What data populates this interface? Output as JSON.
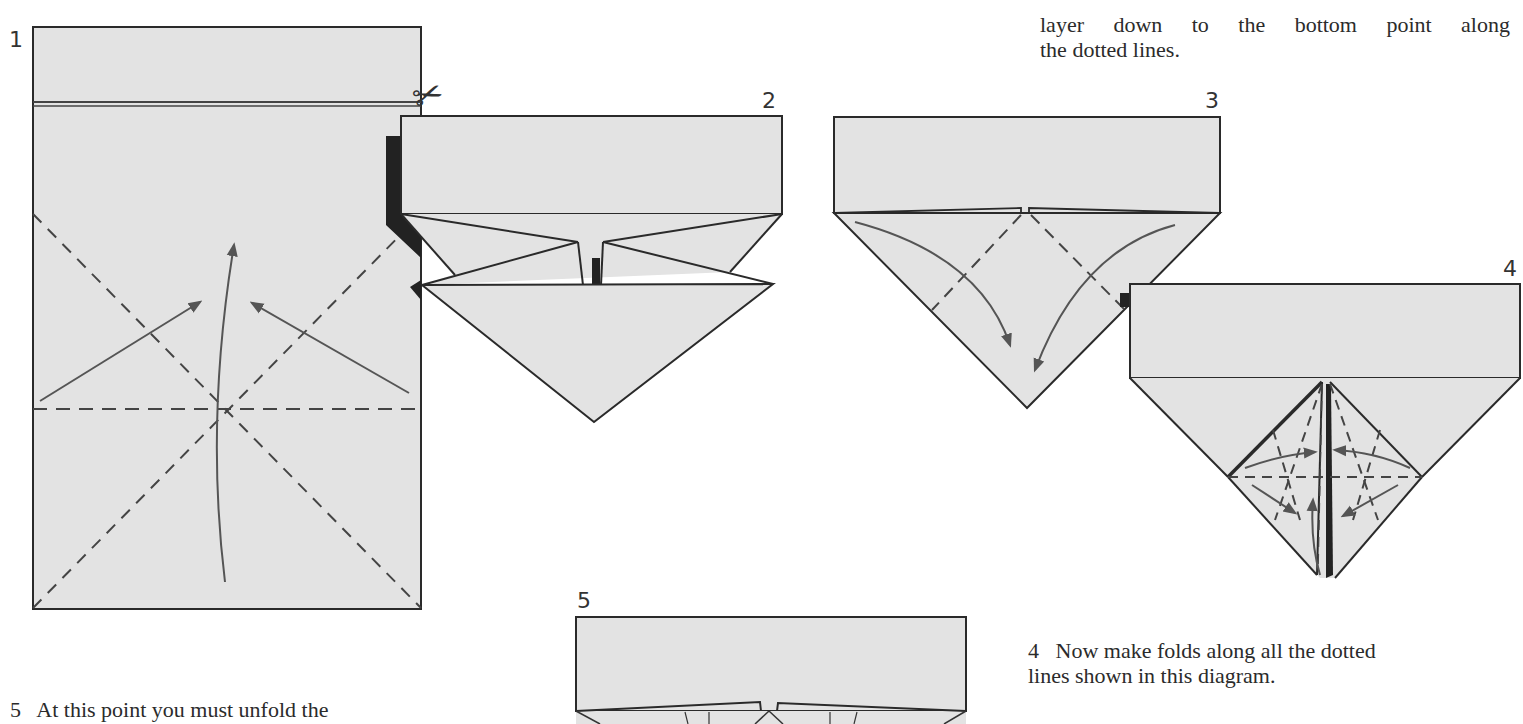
{
  "page": {
    "background": "#ffffff",
    "paper_fill": "#e3e3e3",
    "line_color": "#2a2a2a",
    "arrow_color": "#555555"
  },
  "diagrams": [
    {
      "number": "1",
      "label": "Rectangle sheet with cut line, diagonal and horizontal crease lines, fold-up arrows"
    },
    {
      "number": "2",
      "label": "Preliminary fold with triangular flaps"
    },
    {
      "number": "3",
      "label": "Triangle base with flaps folded down along dotted lines"
    },
    {
      "number": "4",
      "label": "Diamond with multiple dotted fold lines and arrows"
    },
    {
      "number": "5",
      "label": "Partially unfolded shape"
    }
  ],
  "icons": {
    "scissors": "✂"
  },
  "captions": {
    "top_right": {
      "lines": [
        "layer down to the bottom point along",
        "the dotted lines."
      ]
    },
    "step4": {
      "lines": [
        "4   Now make folds along all the dotted",
        "lines shown in this diagram."
      ]
    },
    "step5": {
      "lines": [
        "5   At this point you must unfold the"
      ]
    }
  }
}
